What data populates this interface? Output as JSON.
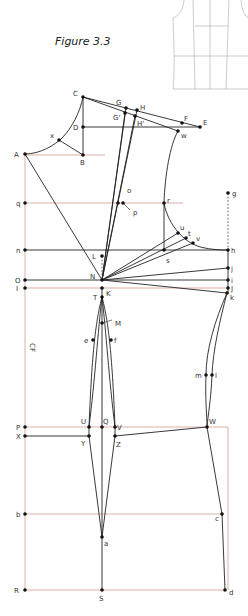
{
  "figure": {
    "title": "Figure 3.3",
    "center_front_label": "CF"
  },
  "colors": {
    "guide_line": "#d9a79e",
    "draft_line": "#222222",
    "point": "#111111",
    "thumbnail": "#aaaaaa"
  },
  "points": [
    {
      "id": "A",
      "x": 25,
      "y": 154,
      "lx": 14,
      "ly": 157
    },
    {
      "id": "B",
      "x": 83,
      "y": 155,
      "lx": 80,
      "ly": 165
    },
    {
      "id": "C",
      "x": 83,
      "y": 97,
      "lx": 73,
      "ly": 96
    },
    {
      "id": "D",
      "x": 83,
      "y": 127,
      "lx": 73,
      "ly": 130
    },
    {
      "id": "x",
      "x": 59,
      "y": 140,
      "lx": 50,
      "ly": 138
    },
    {
      "id": "G",
      "x": 126,
      "y": 108,
      "lx": 116,
      "ly": 105
    },
    {
      "id": "H",
      "x": 137,
      "y": 110,
      "lx": 140,
      "ly": 110
    },
    {
      "id": "G'",
      "x": 125,
      "y": 113,
      "lx": 113,
      "ly": 120
    },
    {
      "id": "H'",
      "x": 135,
      "y": 116,
      "lx": 137,
      "ly": 126
    },
    {
      "id": "F",
      "x": 182,
      "y": 123,
      "lx": 184,
      "ly": 121
    },
    {
      "id": "E",
      "x": 200,
      "y": 127,
      "lx": 203,
      "ly": 125
    },
    {
      "id": "w",
      "x": 178,
      "y": 131,
      "lx": 181,
      "ly": 138
    },
    {
      "id": "q",
      "x": 25,
      "y": 203,
      "lx": 16,
      "ly": 206
    },
    {
      "id": "o",
      "x": 118,
      "y": 203,
      "lx": 127,
      "ly": 193
    },
    {
      "id": "p",
      "x": 123,
      "y": 203,
      "lx": 133,
      "ly": 215
    },
    {
      "id": "r",
      "x": 164,
      "y": 203,
      "lx": 167,
      "ly": 203
    },
    {
      "id": "g",
      "x": 228,
      "y": 193,
      "lx": 232,
      "ly": 196
    },
    {
      "id": "n",
      "x": 25,
      "y": 250,
      "lx": 16,
      "ly": 253
    },
    {
      "id": "u",
      "x": 178,
      "y": 233,
      "lx": 180,
      "ly": 230
    },
    {
      "id": "t",
      "x": 186,
      "y": 238,
      "lx": 188,
      "ly": 236
    },
    {
      "id": "v",
      "x": 193,
      "y": 243,
      "lx": 196,
      "ly": 241
    },
    {
      "id": "s",
      "x": 164,
      "y": 250,
      "lx": 166,
      "ly": 263
    },
    {
      "id": "h",
      "x": 228,
      "y": 250,
      "lx": 231,
      "ly": 253
    },
    {
      "id": "L",
      "x": 102,
      "y": 256,
      "lx": 92,
      "ly": 259
    },
    {
      "id": "N",
      "x": 102,
      "y": 280,
      "lx": 90,
      "ly": 279
    },
    {
      "id": "O",
      "x": 25,
      "y": 280,
      "lx": 15,
      "ly": 283
    },
    {
      "id": "j",
      "x": 228,
      "y": 268,
      "lx": 231,
      "ly": 271
    },
    {
      "id": "i",
      "x": 228,
      "y": 280,
      "lx": 231,
      "ly": 283
    },
    {
      "id": "I",
      "x": 25,
      "y": 288,
      "lx": 16,
      "ly": 291
    },
    {
      "id": "J",
      "x": 228,
      "y": 288,
      "lx": 231,
      "ly": 291
    },
    {
      "id": "K",
      "x": 102,
      "y": 288,
      "lx": 106,
      "ly": 296
    },
    {
      "id": "k",
      "x": 227,
      "y": 293,
      "lx": 230,
      "ly": 300
    },
    {
      "id": "T",
      "x": 102,
      "y": 297,
      "lx": 93,
      "ly": 300
    },
    {
      "id": "M",
      "x": 102,
      "y": 323,
      "lx": 115,
      "ly": 326
    },
    {
      "id": "e",
      "x": 93,
      "y": 340,
      "lx": 84,
      "ly": 343
    },
    {
      "id": "f",
      "x": 111,
      "y": 340,
      "lx": 114,
      "ly": 343
    },
    {
      "id": "m",
      "x": 206,
      "y": 375,
      "lx": 195,
      "ly": 378
    },
    {
      "id": "l",
      "x": 212,
      "y": 375,
      "lx": 215,
      "ly": 378
    },
    {
      "id": "P",
      "x": 25,
      "y": 427,
      "lx": 16,
      "ly": 430
    },
    {
      "id": "U",
      "x": 89,
      "y": 427,
      "lx": 81,
      "ly": 424
    },
    {
      "id": "Q",
      "x": 102,
      "y": 427,
      "lx": 103,
      "ly": 424
    },
    {
      "id": "V",
      "x": 115,
      "y": 427,
      "lx": 117,
      "ly": 430
    },
    {
      "id": "W",
      "x": 207,
      "y": 427,
      "lx": 209,
      "ly": 424
    },
    {
      "id": "X",
      "x": 25,
      "y": 436,
      "lx": 16,
      "ly": 439
    },
    {
      "id": "Y",
      "x": 89,
      "y": 436,
      "lx": 81,
      "ly": 446
    },
    {
      "id": "Z",
      "x": 115,
      "y": 436,
      "lx": 116,
      "ly": 447
    },
    {
      "id": "b",
      "x": 25,
      "y": 514,
      "lx": 16,
      "ly": 517
    },
    {
      "id": "c",
      "x": 222,
      "y": 514,
      "lx": 215,
      "ly": 521
    },
    {
      "id": "a",
      "x": 102,
      "y": 537,
      "lx": 104,
      "ly": 546
    },
    {
      "id": "R",
      "x": 25,
      "y": 590,
      "lx": 14,
      "ly": 593
    },
    {
      "id": "S",
      "x": 102,
      "y": 590,
      "lx": 99,
      "ly": 601
    },
    {
      "id": "d",
      "x": 225,
      "y": 590,
      "lx": 229,
      "ly": 595
    }
  ]
}
